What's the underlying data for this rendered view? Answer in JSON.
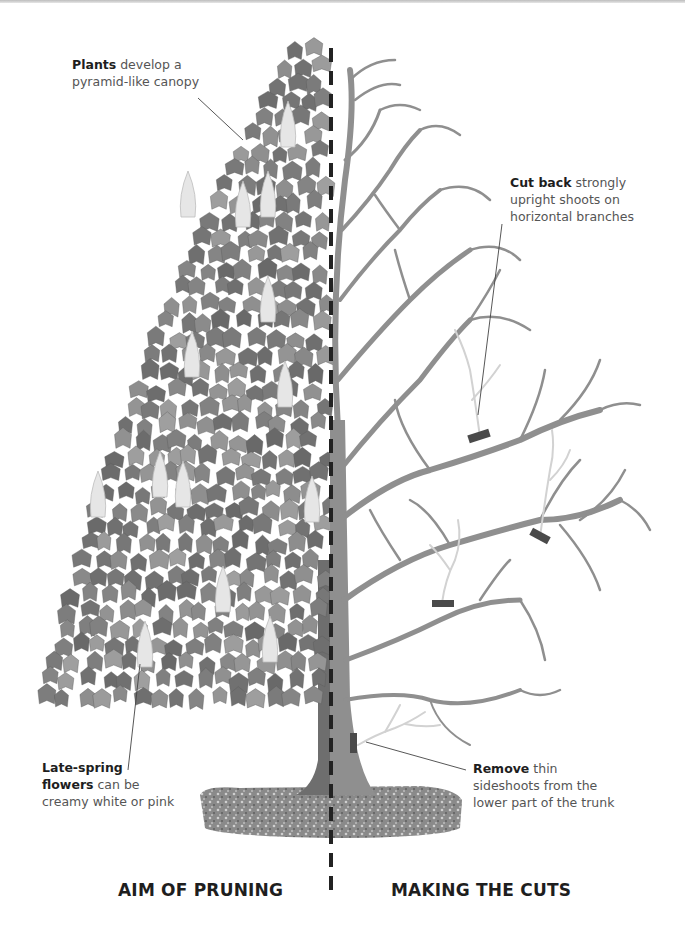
{
  "diagram": {
    "colors": {
      "foliage": "#8a8a8a",
      "foliage_dark": "#5e5e5e",
      "flower": "#e8e8e8",
      "trunk_left": "#6e6e6e",
      "branches": "#8f8f8f",
      "removed_shoots": "#cfcfcf",
      "cut_mark": "#4a4a4a",
      "divider": "#222222",
      "ground": "#7a7a7a"
    },
    "annotations": {
      "canopy": {
        "bold": "Plants",
        "line1_rest": " develop a",
        "line2": "pyramid-like canopy"
      },
      "cut_back": {
        "bold": "Cut back",
        "line1_rest": " strongly",
        "line2": "upright shoots on",
        "line3": "horizontal branches"
      },
      "flowers": {
        "bold1": "Late-spring",
        "bold2": "flowers",
        "line2_rest": " can be",
        "line3": "creamy white or pink"
      },
      "remove": {
        "bold": "Remove",
        "line1_rest": " thin",
        "line2": "sideshoots from the",
        "line3": "lower part of the trunk"
      }
    },
    "captions": {
      "left": "AIM OF PRUNING",
      "right": "MAKING THE CUTS"
    },
    "cut_marks": [
      {
        "name": "cut-upright-shoot-upper"
      },
      {
        "name": "cut-upright-shoot-right"
      },
      {
        "name": "cut-upright-shoot-lower"
      },
      {
        "name": "cut-trunk-sideshoot"
      }
    ]
  }
}
